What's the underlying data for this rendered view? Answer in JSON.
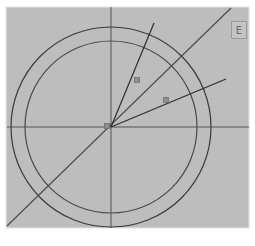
{
  "diagram": {
    "panel": {
      "x": 6,
      "y": 7,
      "width": 243,
      "height": 221,
      "fill": "#bdbdbd",
      "border": "#e4e4e4"
    },
    "center": {
      "x": 111,
      "y": 127
    },
    "circles": [
      {
        "name": "outer-circle",
        "r": 100,
        "stroke": "#3a3a3a"
      },
      {
        "name": "inner-circle",
        "r": 86,
        "stroke": "#4a4a4a"
      }
    ],
    "axes": {
      "horizontal": {
        "x1": 7,
        "y1": 127,
        "x2": 249,
        "y2": 127
      },
      "vertical": {
        "x1": 111,
        "y1": 7,
        "x2": 111,
        "y2": 228
      },
      "stroke": "#555555"
    },
    "lines": [
      {
        "name": "diagonal-line",
        "x1": 7,
        "y1": 226,
        "x2": 231,
        "y2": 8,
        "stroke": "#4d4d4d"
      },
      {
        "name": "ray-steep",
        "x1": 111,
        "y1": 127,
        "x2": 154,
        "y2": 23,
        "stroke": "#2e2e2e"
      },
      {
        "name": "ray-shallow",
        "x1": 111,
        "y1": 127,
        "x2": 226,
        "y2": 79,
        "stroke": "#2e2e2e"
      }
    ],
    "markers": [
      {
        "name": "marker-1",
        "x": 137,
        "y": 80
      },
      {
        "name": "marker-2",
        "x": 166,
        "y": 100
      },
      {
        "name": "marker-center",
        "x": 107,
        "y": 126
      }
    ],
    "marker_fill": "#8e8e8e",
    "marker_stroke": "#707070"
  },
  "toolbar": {
    "button_label": "E",
    "button_icon": "panel-toggle-icon"
  }
}
